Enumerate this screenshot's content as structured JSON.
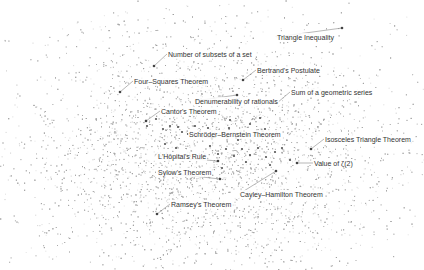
{
  "chart_data": {
    "type": "scatter",
    "title": "",
    "xlabel": "",
    "ylabel": "",
    "grid": false,
    "legend": null,
    "background_cloud": {
      "center": [
        210,
        150
      ],
      "spread": [
        120,
        85
      ],
      "color": "#9a9a9a"
    },
    "highlight_points": [
      [
        156,
        119
      ],
      [
        163,
        129
      ],
      [
        170,
        126
      ],
      [
        178,
        127
      ],
      [
        182,
        132
      ],
      [
        188,
        134
      ],
      [
        195,
        126
      ],
      [
        200,
        131
      ],
      [
        208,
        128
      ],
      [
        214,
        137
      ],
      [
        222,
        133
      ],
      [
        229,
        128
      ],
      [
        236,
        138
      ],
      [
        244,
        131
      ],
      [
        250,
        124
      ],
      [
        256,
        133
      ],
      [
        265,
        129
      ],
      [
        272,
        137
      ],
      [
        210,
        146
      ],
      [
        218,
        154
      ],
      [
        226,
        149
      ],
      [
        234,
        156
      ],
      [
        242,
        149
      ],
      [
        250,
        155
      ],
      [
        258,
        148
      ],
      [
        266,
        157
      ],
      [
        275,
        152
      ],
      [
        282,
        148
      ],
      [
        290,
        160
      ],
      [
        246,
        162
      ],
      [
        238,
        140
      ],
      [
        198,
        112
      ],
      [
        230,
        120
      ],
      [
        260,
        118
      ],
      [
        176,
        148
      ],
      [
        222,
        168
      ],
      [
        270,
        165
      ],
      [
        147,
        126
      ],
      [
        165,
        144
      ],
      [
        190,
        156
      ]
    ],
    "annotations": [
      {
        "text": "Triangle Inequality",
        "point": [
          342,
          28
        ],
        "label": [
          276,
          33
        ]
      },
      {
        "text": "Number of subsets of a set",
        "point": [
          154,
          66
        ],
        "label": [
          167,
          50
        ]
      },
      {
        "text": "Bertrand's Postulate",
        "point": [
          243,
          80
        ],
        "label": [
          256,
          66
        ]
      },
      {
        "text": "Four–Squares Theorem",
        "point": [
          120,
          92
        ],
        "label": [
          133,
          77
        ]
      },
      {
        "text": "Sum of a geometric series",
        "point": [
          277,
          103
        ],
        "label": [
          290,
          88
        ]
      },
      {
        "text": "Denumerability of rationals",
        "point": [
          237,
          95
        ],
        "label": [
          194,
          97
        ]
      },
      {
        "text": "Cantor's Theorem",
        "point": [
          146,
          121
        ],
        "label": [
          160,
          107
        ]
      },
      {
        "text": "Schröder–Bernstein Theorem",
        "point": [
          212,
          138
        ],
        "label": [
          188,
          130
        ]
      },
      {
        "text": "Isosceles Triangle Theorem",
        "point": [
          311,
          149
        ],
        "label": [
          324,
          135
        ]
      },
      {
        "text": "L'Hôpital's Rule",
        "point": [
          218,
          161
        ],
        "label": [
          157,
          152
        ]
      },
      {
        "text": "Value of ζ(2)",
        "point": [
          297,
          163
        ],
        "label": [
          313,
          159
        ]
      },
      {
        "text": "Sylow's Theorem",
        "point": [
          220,
          179
        ],
        "label": [
          157,
          168
        ]
      },
      {
        "text": "Cayley–Hamilton Theorem",
        "point": [
          276,
          171
        ],
        "label": [
          239,
          190
        ]
      },
      {
        "text": "Ramsey's Theorem",
        "point": [
          157,
          214
        ],
        "label": [
          170,
          200
        ]
      }
    ]
  }
}
